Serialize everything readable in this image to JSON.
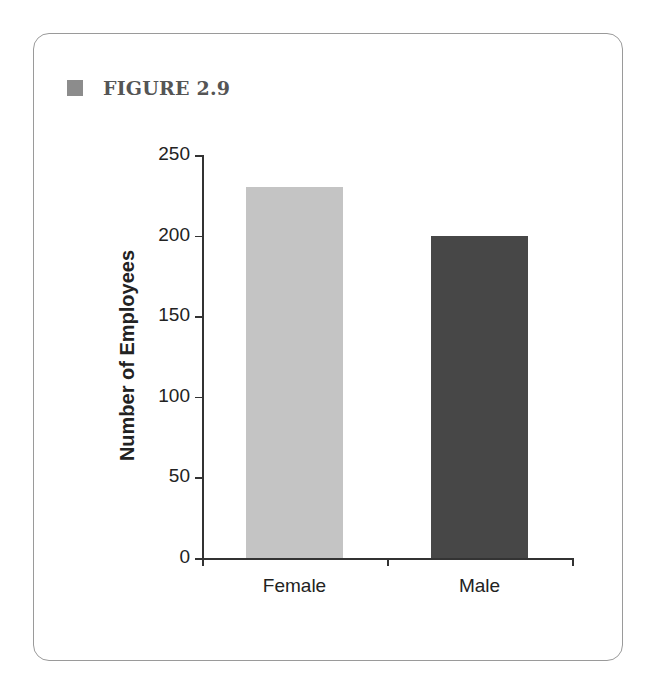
{
  "figure": {
    "label": "FIGURE 2.9"
  },
  "chart_data": {
    "type": "bar",
    "title": "",
    "categories": [
      "Female",
      "Male"
    ],
    "values": [
      230,
      200
    ],
    "xlabel": "",
    "ylabel": "Number of Employees",
    "ylim": [
      0,
      250
    ],
    "yticks": [
      "0",
      "50",
      "100",
      "150",
      "200",
      "250"
    ],
    "grid": false,
    "legend": null,
    "colors": [
      "#c4c4c4",
      "#474747"
    ]
  }
}
